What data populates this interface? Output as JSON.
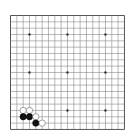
{
  "board": {
    "size": 19,
    "origin_x": 10.5,
    "origin_y": 15.5,
    "spacing": 6.33,
    "line_color": "#8a8a8a",
    "edge_color": "#555555",
    "background": "#ffffff",
    "star_points": [
      [
        4,
        4
      ],
      [
        10,
        4
      ],
      [
        16,
        4
      ],
      [
        4,
        10
      ],
      [
        10,
        10
      ],
      [
        16,
        10
      ],
      [
        4,
        16
      ],
      [
        10,
        16
      ],
      [
        16,
        16
      ]
    ],
    "stones": [
      {
        "color": "white",
        "col": 3,
        "row": 16
      },
      {
        "color": "white",
        "col": 4,
        "row": 16
      },
      {
        "color": "black",
        "col": 3,
        "row": 17
      },
      {
        "color": "black",
        "col": 4,
        "row": 17
      },
      {
        "color": "white",
        "col": 5,
        "row": 17
      },
      {
        "color": "black",
        "col": 5,
        "row": 18
      },
      {
        "color": "white",
        "col": 6,
        "row": 18
      }
    ]
  }
}
